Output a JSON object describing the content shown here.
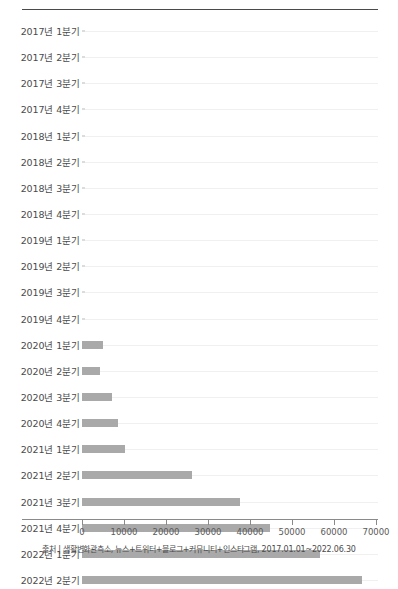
{
  "chart": {
    "title": "",
    "source_note": "출처 | 생활변화관측소, 뉴스+트위터+블로그+커뮤니티+인스타그램, 2017.01.01~2022.06.30"
  },
  "chart_data": {
    "type": "bar",
    "orientation": "horizontal",
    "title": "",
    "xlabel": "",
    "ylabel": "",
    "xlim": [
      0,
      73000
    ],
    "grid": true,
    "legend": false,
    "xticks": [
      0,
      10000,
      20000,
      30000,
      40000,
      50000,
      60000,
      70000
    ],
    "xtick_labels": [
      "0",
      "10000",
      "20000",
      "30000",
      "40000",
      "50000",
      "60000",
      "70000"
    ],
    "categories": [
      "2017년 1분기",
      "2017년 2분기",
      "2017년 3분기",
      "2017년 4분기",
      "2018년 1분기",
      "2018년 2분기",
      "2018년 3분기",
      "2018년 4분기",
      "2019년 1분기",
      "2019년 2분기",
      "2019년 3분기",
      "2019년 4분기",
      "2020년 1분기",
      "2020년 2분기",
      "2020년 3분기",
      "2020년 4분기",
      "2021년 1분기",
      "2021년 2분기",
      "2021년 3분기",
      "2021년 4분기",
      "2022년 1분기",
      "2022년 2분기"
    ],
    "values": [
      0,
      0,
      0,
      0,
      0,
      0,
      0,
      0,
      0,
      0,
      0,
      0,
      5000,
      4300,
      7100,
      8600,
      10200,
      26200,
      37600,
      44800,
      56700,
      66700
    ],
    "bar_color": "#a9a9a9"
  }
}
